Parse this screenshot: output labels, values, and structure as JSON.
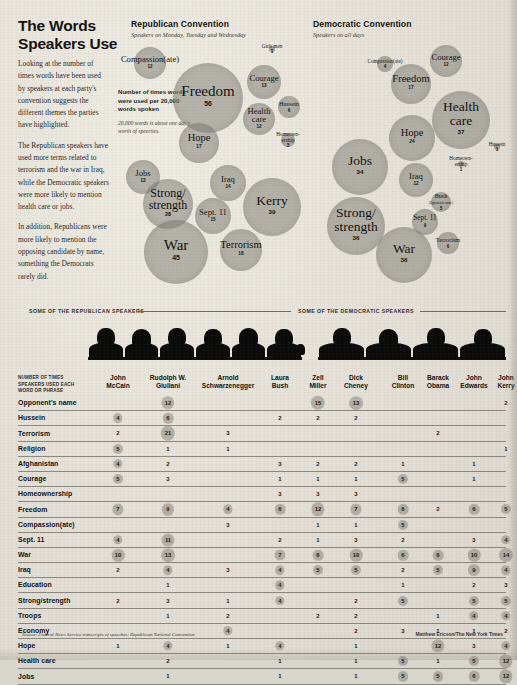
{
  "headline": "The Words Speakers Use",
  "intro_paragraphs": [
    "Looking at the number of times words have been used by speakers at each party's convention suggests the different themes the parties have highlighted.",
    "The Republican speakers have used more terms related to terrorism and the war in Iraq, while the Democratic speakers were more likely to mention health care or jobs.",
    "In addition, Republicans were more likely to mention the opposing candidate by name, something the Democrats rarely did."
  ],
  "key": {
    "line1": "Number of times words were used per 20,000 words spoken",
    "line2": "20,000 words is about one day's worth of speeches."
  },
  "panels": {
    "republican": {
      "title": "Republican Convention",
      "subtitle": "Speakers on Monday, Tuesday and Wednesday",
      "band_caption": "SOME OF THE REPUBLICAN SPEAKERS"
    },
    "democratic": {
      "title": "Democratic Convention",
      "subtitle": "Speakers on all days",
      "band_caption": "SOME OF THE DEMOCRATIC SPEAKERS"
    }
  },
  "chart_data": {
    "type": "bubble",
    "title": "The Words Speakers Use",
    "unit": "times used per 20,000 words spoken",
    "series": [
      {
        "name": "Republican Convention",
        "bubbles": [
          {
            "label": "Compassion(ate)",
            "value": 12,
            "cx": 150,
            "cy": 63,
            "r": 16
          },
          {
            "label": "Girls men",
            "value": 1,
            "cx": 272,
            "cy": 49,
            "r": 3
          },
          {
            "label": "Freedom",
            "value": 56,
            "cx": 208,
            "cy": 98,
            "r": 35
          },
          {
            "label": "Courage",
            "value": 13,
            "cx": 264,
            "cy": 82,
            "r": 17
          },
          {
            "label": "Hussein",
            "value": 6,
            "cx": 289,
            "cy": 107,
            "r": 11
          },
          {
            "label": "Health care",
            "value": 12,
            "cx": 259,
            "cy": 119,
            "r": 16
          },
          {
            "label": "Homeownership",
            "value": 3,
            "cx": 288,
            "cy": 140,
            "r": 7
          },
          {
            "label": "Hope",
            "value": 17,
            "cx": 199,
            "cy": 143,
            "r": 20
          },
          {
            "label": "Jobs",
            "value": 13,
            "cx": 143,
            "cy": 177,
            "r": 17
          },
          {
            "label": "Iraq",
            "value": 14,
            "cx": 228,
            "cy": 183,
            "r": 18
          },
          {
            "label": "Strong/strength",
            "value": 28,
            "cx": 168,
            "cy": 204,
            "r": 25
          },
          {
            "label": "Kerry",
            "value": 39,
            "cx": 272,
            "cy": 207,
            "r": 29
          },
          {
            "label": "Sept. 11",
            "value": 15,
            "cx": 213,
            "cy": 216,
            "r": 18
          },
          {
            "label": "Terrorism",
            "value": 18,
            "cx": 241,
            "cy": 250,
            "r": 21
          },
          {
            "label": "War",
            "value": 45,
            "cx": 176,
            "cy": 252,
            "r": 32
          }
        ]
      },
      {
        "name": "Democratic Convention",
        "bubbles": [
          {
            "label": "Compassion(ate)",
            "value": 4,
            "cx": 385,
            "cy": 64,
            "r": 8
          },
          {
            "label": "Courage",
            "value": 12,
            "cx": 446,
            "cy": 61,
            "r": 16
          },
          {
            "label": "Freedom",
            "value": 17,
            "cx": 411,
            "cy": 84,
            "r": 20
          },
          {
            "label": "Health care",
            "value": 37,
            "cx": 461,
            "cy": 120,
            "r": 29
          },
          {
            "label": "Hussein",
            "value": 1,
            "cx": 497,
            "cy": 147,
            "r": 3
          },
          {
            "label": "Hope",
            "value": 24,
            "cx": 412,
            "cy": 138,
            "r": 23
          },
          {
            "label": "Homeownership",
            "value": 1,
            "cx": 461,
            "cy": 164,
            "r": 3
          },
          {
            "label": "Jobs",
            "value": 34,
            "cx": 360,
            "cy": 167,
            "r": 28
          },
          {
            "label": "Iraq",
            "value": 12,
            "cx": 416,
            "cy": 180,
            "r": 17
          },
          {
            "label": "Bush (Opponent's name)",
            "value": 5,
            "cx": 441,
            "cy": 202,
            "r": 10
          },
          {
            "label": "Strong/strength",
            "value": 36,
            "cx": 356,
            "cy": 226,
            "r": 29
          },
          {
            "label": "Sept. 11",
            "value": 9,
            "cx": 425,
            "cy": 222,
            "r": 13
          },
          {
            "label": "Terrorism",
            "value": 6,
            "cx": 448,
            "cy": 243,
            "r": 11
          },
          {
            "label": "War",
            "value": 36,
            "cx": 404,
            "cy": 255,
            "r": 28
          }
        ]
      }
    ]
  },
  "table": {
    "corner_note": "NUMBER OF TIMES SPEAKERS USED EACH WORD OR PHRASE",
    "columns": [
      {
        "first": "John",
        "last": "McCain"
      },
      {
        "first": "Rudolph W.",
        "last": "Giuliani"
      },
      {
        "first": "Arnold",
        "last": "Schwarzenegger"
      },
      {
        "first": "Laura",
        "last": "Bush"
      },
      {
        "first": "Zell",
        "last": "Miller"
      },
      {
        "first": "Dick",
        "last": "Cheney"
      },
      {
        "first": "Bill",
        "last": "Clinton"
      },
      {
        "first": "Barack",
        "last": "Obama"
      },
      {
        "first": "John",
        "last": "Edwards"
      },
      {
        "first": "John",
        "last": "Kerry"
      }
    ],
    "rows": [
      {
        "label": "Opponent's name",
        "values": [
          null,
          12,
          null,
          null,
          15,
          13,
          null,
          null,
          null,
          2
        ]
      },
      {
        "label": "Hussein",
        "values": [
          4,
          6,
          null,
          2,
          2,
          2,
          null,
          null,
          null,
          null
        ]
      },
      {
        "label": "Terrorism",
        "values": [
          2,
          21,
          3,
          null,
          null,
          null,
          null,
          2,
          null,
          null
        ]
      },
      {
        "label": "Religion",
        "values": [
          5,
          1,
          1,
          null,
          null,
          null,
          null,
          null,
          null,
          1
        ]
      },
      {
        "label": "Afghanistan",
        "values": [
          4,
          2,
          null,
          3,
          2,
          2,
          1,
          null,
          1,
          null
        ]
      },
      {
        "label": "Courage",
        "values": [
          5,
          3,
          null,
          1,
          1,
          1,
          5,
          null,
          1,
          null
        ]
      },
      {
        "label": "Homeownership",
        "values": [
          null,
          null,
          null,
          3,
          3,
          3,
          null,
          null,
          null,
          null
        ]
      },
      {
        "label": "Freedom",
        "values": [
          7,
          9,
          4,
          6,
          12,
          7,
          6,
          2,
          6,
          5
        ]
      },
      {
        "label": "Compassion(ate)",
        "values": [
          null,
          null,
          3,
          null,
          1,
          1,
          5,
          null,
          null,
          null
        ]
      },
      {
        "label": "Sept. 11",
        "values": [
          4,
          11,
          null,
          2,
          1,
          3,
          2,
          null,
          3,
          4
        ]
      },
      {
        "label": "War",
        "values": [
          10,
          13,
          null,
          7,
          6,
          10,
          6,
          6,
          10,
          14
        ]
      },
      {
        "label": "Iraq",
        "values": [
          2,
          4,
          3,
          4,
          5,
          5,
          2,
          5,
          9,
          4
        ]
      },
      {
        "label": "Education",
        "values": [
          null,
          1,
          null,
          4,
          null,
          null,
          1,
          null,
          2,
          3
        ]
      },
      {
        "label": "Strong/strength",
        "values": [
          2,
          3,
          1,
          4,
          null,
          2,
          5,
          null,
          5,
          5
        ]
      },
      {
        "label": "Troops",
        "values": [
          null,
          1,
          2,
          null,
          2,
          2,
          null,
          1,
          4,
          4
        ]
      },
      {
        "label": "Economy",
        "values": [
          null,
          null,
          4,
          null,
          null,
          2,
          3,
          1,
          1,
          2
        ]
      },
      {
        "label": "Hope",
        "values": [
          1,
          4,
          1,
          4,
          null,
          1,
          null,
          12,
          3,
          4
        ]
      },
      {
        "label": "Health care",
        "values": [
          null,
          2,
          null,
          1,
          null,
          1,
          5,
          1,
          5,
          12
        ]
      },
      {
        "label": "Jobs",
        "values": [
          null,
          1,
          null,
          1,
          null,
          1,
          5,
          5,
          6,
          12
        ]
      }
    ]
  },
  "footer": {
    "source": "Source: Federal News Service transcripts of speeches; Republican National Convention",
    "credit": "Matthew Ericson/The New York Times"
  }
}
